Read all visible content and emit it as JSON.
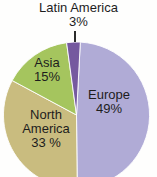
{
  "chart_data": {
    "type": "pie",
    "title": "",
    "legend": "none",
    "order": "clockwise from 12 o'clock",
    "slices": [
      {
        "label": "Europe",
        "value": 49,
        "display": "Europe\n49%",
        "color": "#b0abd6",
        "label_position": "inside"
      },
      {
        "label": "North America",
        "value": 33,
        "display": "North\nAmerica\n33 %",
        "color": "#c9bc7f",
        "label_position": "inside"
      },
      {
        "label": "Asia",
        "value": 15,
        "display": "Asia\n15%",
        "color": "#a5c55e",
        "label_position": "inside"
      },
      {
        "label": "Latin America",
        "value": 3,
        "display": "Latin America\n3%",
        "color": "#75599f",
        "label_position": "outside-top with leader line"
      }
    ],
    "colors": {
      "label_text": "#1d1d1d",
      "slice_separator": "#ffffff",
      "background": "#fefefd"
    }
  }
}
